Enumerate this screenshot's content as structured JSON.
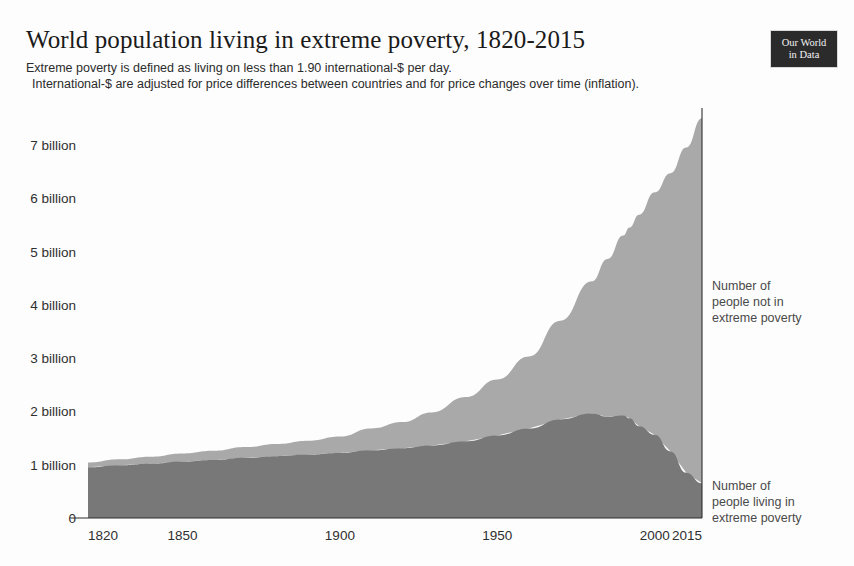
{
  "header": {
    "title": "World population living in extreme poverty, 1820-2015",
    "subtitle_line_1": "Extreme poverty is defined as living on less than 1.90 international-$ per day.",
    "subtitle_line_2": "International-$ are adjusted for price differences between countries and for price changes over time (inflation).",
    "logo_line_1": "Our World",
    "logo_line_2": "in Data"
  },
  "colors": {
    "not_in_poverty": "#a9a9a9",
    "in_poverty": "#787878",
    "axis": "#2f2f2f",
    "text": "#2f2f2f",
    "annotation": "#4a4a4a",
    "background": "#fdfdfd",
    "logo_background": "#2b2b2b"
  },
  "annotations": {
    "upper": "Number of\npeople not in\nextreme poverty",
    "upper_lines": [
      "Number of",
      "people not in",
      "extreme poverty"
    ],
    "lower": "Number of\npeople living in\nextreme poverty",
    "lower_lines": [
      "Number of",
      "people living in",
      "extreme poverty"
    ]
  },
  "chart_data": {
    "type": "area",
    "stacked": true,
    "title": "World population living in extreme poverty, 1820-2015",
    "subtitle": "Extreme poverty is defined as living on less than 1.90 international-$ per day. International-$ are adjusted for price differences between countries and for price changes over time (inflation).",
    "xlabel": "",
    "ylabel": "",
    "unit": "billion people",
    "xlim": [
      1820,
      2015
    ],
    "ylim": [
      0,
      7.6
    ],
    "grid": false,
    "legend_position": "right-annotations",
    "y_ticks": [
      0,
      1,
      2,
      3,
      4,
      5,
      6,
      7
    ],
    "y_tick_labels": [
      "0",
      "1 billion",
      "2 billion",
      "3 billion",
      "4 billion",
      "5 billion",
      "6 billion",
      "7 billion"
    ],
    "x_ticks": [
      1820,
      1850,
      1900,
      1950,
      2000,
      2015
    ],
    "x_tick_labels": [
      "1820",
      "1850",
      "1900",
      "1950",
      "2000",
      "2015"
    ],
    "x": [
      1820,
      1830,
      1840,
      1850,
      1860,
      1870,
      1880,
      1890,
      1900,
      1910,
      1920,
      1929,
      1940,
      1950,
      1960,
      1970,
      1980,
      1985,
      1990,
      1992,
      1995,
      2000,
      2005,
      2010,
      2015
    ],
    "series": [
      {
        "name": "Number of people living in extreme poverty",
        "color": "#787878",
        "values": [
          0.95,
          0.99,
          1.02,
          1.06,
          1.09,
          1.13,
          1.16,
          1.19,
          1.22,
          1.27,
          1.31,
          1.36,
          1.44,
          1.55,
          1.68,
          1.85,
          1.96,
          1.9,
          1.93,
          1.87,
          1.72,
          1.56,
          1.25,
          0.85,
          0.65
        ]
      },
      {
        "name": "Number of people not in extreme poverty",
        "color": "#a9a9a9",
        "values": [
          0.09,
          0.11,
          0.13,
          0.15,
          0.17,
          0.2,
          0.23,
          0.26,
          0.31,
          0.41,
          0.49,
          0.62,
          0.83,
          1.05,
          1.35,
          1.85,
          2.48,
          2.96,
          3.37,
          3.58,
          3.97,
          4.55,
          5.22,
          6.1,
          6.85
        ]
      }
    ],
    "totals": [
      1.04,
      1.1,
      1.15,
      1.21,
      1.26,
      1.33,
      1.39,
      1.45,
      1.53,
      1.68,
      1.8,
      1.98,
      2.27,
      2.6,
      3.03,
      3.7,
      4.44,
      4.86,
      5.3,
      5.45,
      5.69,
      6.11,
      6.47,
      6.95,
      7.5
    ]
  }
}
